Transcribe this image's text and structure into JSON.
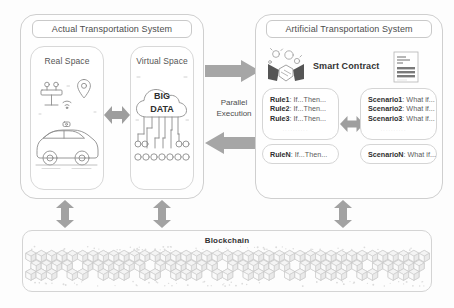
{
  "diagram": {
    "background_color": "#fdfdfd",
    "arrow_color": "#9e9e9e",
    "line_color": "#c9c9c9"
  },
  "actual_system": {
    "title": "Actual Transportation System",
    "real_space": {
      "label": "Real Space",
      "icons": [
        "autonomous-car-icon",
        "traffic-light-icon",
        "location-pin-icon",
        "wifi-signal-icon"
      ]
    },
    "virtual_space": {
      "label": "Virtual Space",
      "cloud_line1": "BIG",
      "cloud_line2": "DATA",
      "icons": [
        "cloud-icon",
        "network-nodes-icon"
      ]
    },
    "inner_arrow": "bidirectional-horizontal-arrow"
  },
  "bridge": {
    "label_line1": "Parallel",
    "label_line2": "Execution",
    "top_arrow": "arrow-right",
    "bottom_arrow": "arrow-left"
  },
  "artificial_system": {
    "title": "Artificial Transportation System",
    "smart_contract": {
      "label": "Smart Contract",
      "left_icon": "handshake-icon",
      "right_icon": "contract-document-icon"
    },
    "rules": {
      "items": [
        {
          "name": "Rule1",
          "text": ": If...Then..."
        },
        {
          "name": "Rule2",
          "text": ": If...Then..."
        },
        {
          "name": "Rule3",
          "text": ": If...Then..."
        }
      ],
      "ellipsis": ". . . . . . . . . .",
      "tail": {
        "name": "RuleN",
        "text": ": If...Then..."
      }
    },
    "scenarios": {
      "items": [
        {
          "name": "Scenario1",
          "text": ": What if..."
        },
        {
          "name": "Scenario2",
          "text": ": What if..."
        },
        {
          "name": "Scenario3",
          "text": ": What if..."
        }
      ],
      "ellipsis": ". . . . . . . . . .",
      "tail": {
        "name": "ScenarioN",
        "text": ": What if..."
      }
    },
    "inner_arrow": "bidirectional-horizontal-arrow"
  },
  "blockchain": {
    "label": "Blockchain",
    "art": "hexagonal-block-chain-pattern",
    "connector_arrows": [
      "bidirectional-vertical-arrow",
      "bidirectional-vertical-arrow",
      "bidirectional-vertical-arrow"
    ]
  }
}
